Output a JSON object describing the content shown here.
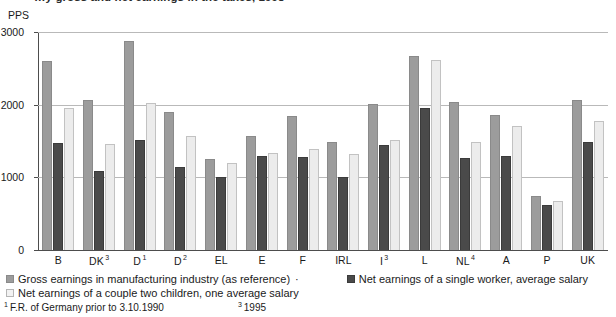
{
  "title_partial": "…y gross and net earnings in the taxes, 1998",
  "unit_label": "PPS",
  "axis": {
    "y_ticks": [
      0,
      1000,
      2000,
      3000
    ],
    "y_min": 0,
    "y_max": 3000
  },
  "legend": {
    "gross_label": "Gross earnings in manufacturing industry (as reference)",
    "separator": "·",
    "net_single_label": "Net earnings of a single worker, average salary",
    "net_couple_label": "Net earnings of a couple two children, one average salary",
    "colors": {
      "gross": "#9c9c9c",
      "net_single": "#4a4a4a",
      "net_couple": "#ececec"
    }
  },
  "footnotes": [
    {
      "marker": "1",
      "text": "F.R. of Germany prior to 3.10.1990"
    },
    {
      "marker": "3",
      "text": "1995"
    }
  ],
  "chart_data": {
    "type": "bar",
    "title": "…y gross and net earnings in the taxes, 1998",
    "xlabel": "",
    "ylabel": "PPS",
    "ylim": [
      0,
      3000
    ],
    "yticks": [
      0,
      1000,
      2000,
      3000
    ],
    "grid": true,
    "legend_position": "bottom",
    "categories": [
      "B",
      "DK",
      "D",
      "D",
      "EL",
      "E",
      "F",
      "IRL",
      "I",
      "L",
      "NL",
      "A",
      "P",
      "UK"
    ],
    "category_footnotes": [
      "",
      "3",
      "1",
      "2",
      "",
      "",
      "",
      "",
      "3",
      "",
      "4",
      "",
      "",
      ""
    ],
    "category_labels": [
      "B",
      "DK³",
      "D¹",
      "D²",
      "EL",
      "E",
      "F",
      "IRL",
      "I³",
      "L",
      "NL⁴",
      "A",
      "P",
      "UK"
    ],
    "series": [
      {
        "name": "Gross earnings in manufacturing industry (as reference)",
        "color": "#9c9c9c",
        "values": [
          2600,
          2060,
          2870,
          1900,
          1250,
          1570,
          1840,
          1480,
          2010,
          2670,
          2040,
          1860,
          740,
          2060
        ]
      },
      {
        "name": "Net earnings of a single worker, average salary",
        "color": "#4a4a4a",
        "values": [
          1470,
          1090,
          1510,
          1140,
          1010,
          1290,
          1280,
          1010,
          1440,
          1960,
          1260,
          1300,
          620,
          1490
        ]
      },
      {
        "name": "Net earnings of a couple two children, one average salary",
        "color": "#ececec",
        "values": [
          1950,
          1460,
          2020,
          1570,
          1200,
          1330,
          1390,
          1320,
          1510,
          2620,
          1480,
          1700,
          670,
          1780
        ]
      }
    ]
  }
}
